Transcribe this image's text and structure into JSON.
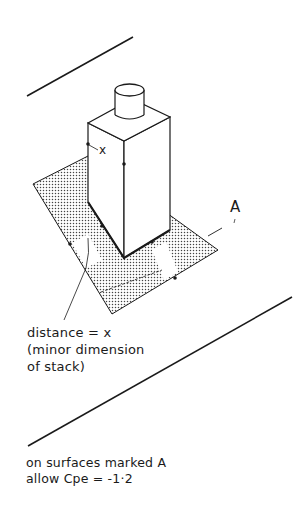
{
  "figure": {
    "type": "isometric wind-load diagram of a stack on a roof",
    "labels": {
      "x_marker": "x",
      "surface_label": "A",
      "distance_note": {
        "line1": "distance = x",
        "line2": "(minor dimension",
        "line3": "of stack)"
      },
      "caption": {
        "line1": "on surfaces marked A",
        "line2": "allow Cpe = -1·2"
      }
    },
    "colors": {
      "ink": "#1a1a1a",
      "hatch": "#555555",
      "background": "#ffffff"
    }
  }
}
